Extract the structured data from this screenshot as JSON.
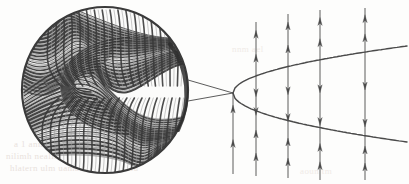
{
  "figure": {
    "title": "Magnified inset of folded laminated layers linked to a parabolic interface with flux arrow columns",
    "background_color": "#fdfdfc",
    "ink_color": "#4a4a4a",
    "ink_color_dark": "#2e2e2e",
    "bleed_text_color": "#e9e2dd"
  },
  "inset": {
    "name": "magnified-circular-inset",
    "shape": "circle",
    "center_x": 105,
    "center_y": 90,
    "radius": 84,
    "rim_color": "#3a3a3a",
    "rim_width": 2.2,
    "fill_color": "#fbfbfa",
    "description": "Dense curved striation bands forming a recumbent fold; light and dark laminae alternate.",
    "band_count": 86,
    "fold_style": "recumbent-nappe"
  },
  "tie_lines": {
    "name": "inset-tie-lines",
    "count": 2,
    "origin_x": 188,
    "upper_origin_y": 80,
    "lower_origin_y": 101,
    "target_x": 233,
    "target_y": 93,
    "color": "#4a4a4a",
    "width": 0.9
  },
  "parabola": {
    "name": "parabolic-interface",
    "vertex_x": 233,
    "vertex_y": 93,
    "color": "#4a4a4a",
    "width": 1.4,
    "upper_branch": {
      "label": "upper-branch",
      "end_x": 407,
      "end_y": 46
    },
    "lower_branch": {
      "label": "lower-branch",
      "end_x": 407,
      "end_y": 142
    }
  },
  "arrow_columns": {
    "name": "flux-arrow-columns",
    "color": "#4a4a4a",
    "stem_width": 0.9,
    "head_length": 8,
    "head_width": 4.4,
    "columns": [
      {
        "id": "column-1",
        "x": 233,
        "top_y": 93,
        "bottom_y": 174,
        "segments": [
          {
            "id": "c1-below",
            "label": "below-lower-branch",
            "direction": "up",
            "arrow_count": 2,
            "from_y": 174,
            "to_y": 93
          }
        ]
      },
      {
        "id": "column-2",
        "x": 256,
        "top_y": 22,
        "bottom_y": 176,
        "segments": [
          {
            "id": "c2-above",
            "label": "above-upper-branch",
            "direction": "up",
            "arrow_count": 2,
            "from_y": 78,
            "to_y": 22
          },
          {
            "id": "c2-between",
            "label": "between-branches",
            "direction": "down",
            "arrow_count": 2,
            "from_y": 78,
            "to_y": 122
          },
          {
            "id": "c2-below",
            "label": "below-lower-branch",
            "direction": "up",
            "arrow_count": 2,
            "from_y": 176,
            "to_y": 122
          }
        ]
      },
      {
        "id": "column-3",
        "x": 288,
        "top_y": 14,
        "bottom_y": 178,
        "segments": [
          {
            "id": "c3-above",
            "label": "above-upper-branch",
            "direction": "up",
            "arrow_count": 2,
            "from_y": 68,
            "to_y": 14
          },
          {
            "id": "c3-between",
            "label": "between-branches",
            "direction": "down",
            "arrow_count": 2,
            "from_y": 68,
            "to_y": 131
          },
          {
            "id": "c3-below",
            "label": "below-lower-branch",
            "direction": "up",
            "arrow_count": 2,
            "from_y": 178,
            "to_y": 131
          }
        ]
      },
      {
        "id": "column-4",
        "x": 320,
        "top_y": 10,
        "bottom_y": 180,
        "segments": [
          {
            "id": "c4-above",
            "label": "above-upper-branch",
            "direction": "up",
            "arrow_count": 2,
            "from_y": 60,
            "to_y": 10
          },
          {
            "id": "c4-between",
            "label": "between-branches",
            "direction": "down",
            "arrow_count": 2,
            "from_y": 60,
            "to_y": 137
          },
          {
            "id": "c4-below",
            "label": "below-lower-branch",
            "direction": "up",
            "arrow_count": 2,
            "from_y": 180,
            "to_y": 137
          }
        ]
      },
      {
        "id": "column-5",
        "x": 365,
        "top_y": 8,
        "bottom_y": 180,
        "segments": [
          {
            "id": "c5-above",
            "label": "above-upper-branch",
            "direction": "up",
            "arrow_count": 2,
            "from_y": 53,
            "to_y": 8
          },
          {
            "id": "c5-between",
            "label": "between-branches",
            "direction": "down",
            "arrow_count": 2,
            "from_y": 53,
            "to_y": 140
          },
          {
            "id": "c5-below",
            "label": "below-lower-branch",
            "direction": "up",
            "arrow_count": 2,
            "from_y": 180,
            "to_y": 140
          }
        ]
      }
    ]
  },
  "bleed_through_text": {
    "note": "Illegible reverse-side print showing through the scanned page",
    "line_1": "a 1 anna  hanno",
    "line_2": "nilimh  neallinn  aeoit  allan",
    "line_3": "hlatern  ulm  uamanan  ipea  1,1  lu",
    "line_4": "nnm  ael",
    "line_5": "aoun  tm"
  }
}
